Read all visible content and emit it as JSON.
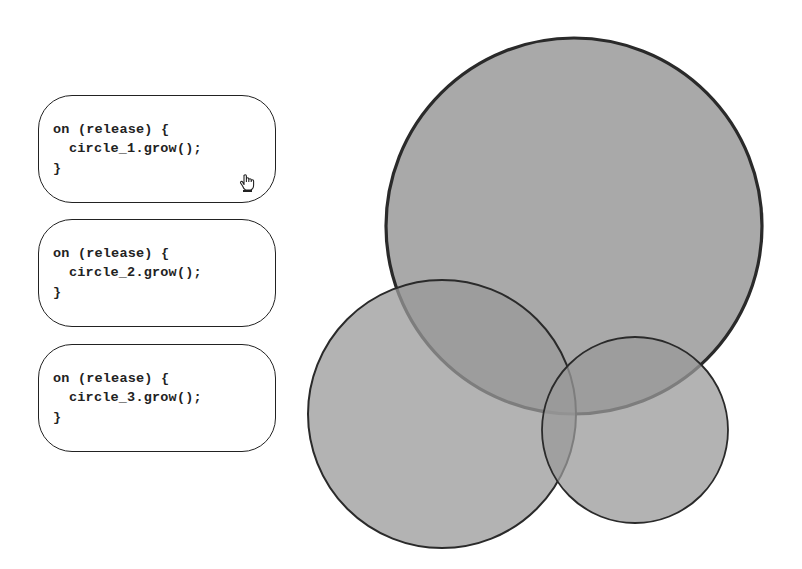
{
  "handlers": [
    {
      "event_line": "on (release) {",
      "call_line": "circle_1.grow();",
      "close_line": "}",
      "target": "circle_1",
      "has_cursor": true
    },
    {
      "event_line": "on (release) {",
      "call_line": "circle_2.grow();",
      "close_line": "}",
      "target": "circle_2",
      "has_cursor": false
    },
    {
      "event_line": "on (release) {",
      "call_line": "circle_3.grow();",
      "close_line": "}",
      "target": "circle_3",
      "has_cursor": false
    }
  ],
  "circles": [
    {
      "id": "circle_1",
      "cx": 574,
      "cy": 226,
      "r": 188,
      "fill": "#9a9a9a",
      "stroke": "#2a2a2a",
      "stroke_width": 3.2
    },
    {
      "id": "circle_2",
      "cx": 442,
      "cy": 414,
      "r": 134,
      "fill": "#9a9a9a",
      "stroke": "#2a2a2a",
      "stroke_width": 2
    },
    {
      "id": "circle_3",
      "cx": 635,
      "cy": 430,
      "r": 93,
      "fill": "#9a9a9a",
      "stroke": "#2a2a2a",
      "stroke_width": 1.8
    }
  ],
  "cursor_icon": "hand-pointer-icon"
}
